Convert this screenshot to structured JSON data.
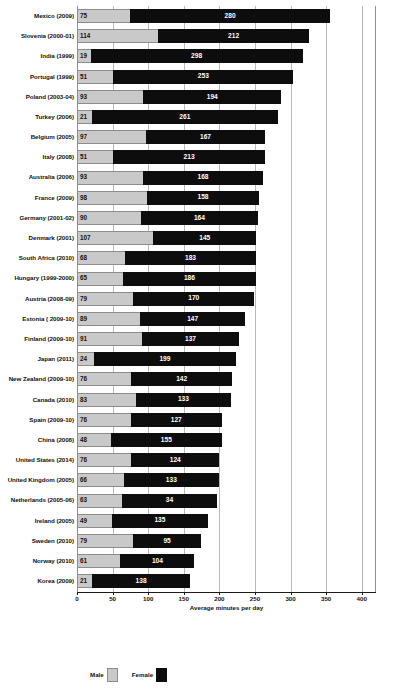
{
  "chart_data": {
    "type": "bar",
    "subtype": "stacked-horizontal",
    "title": "",
    "xlabel": "Average minutes per day",
    "ylabel": "",
    "xlim": [
      0,
      420
    ],
    "xticks": [
      0,
      50,
      100,
      150,
      200,
      250,
      300,
      350,
      400
    ],
    "grid": true,
    "legend_position": "bottom-left",
    "categories": [
      "Mexico (2009)",
      "Slovenia (2000-01)",
      "India (1999)",
      "Portugal (1999)",
      "Poland (2003-04)",
      "Turkey (2006)",
      "Belgium (2005)",
      "Italy (2008)",
      "Australia (2006)",
      "France (2009)",
      "Germany (2001-02)",
      "Denmark (2001)",
      "South Africa (2010)",
      "Hungary (1999-2000)",
      "Austria (2008-09)",
      "Estonia ( 2009-10)",
      "Finland (2009-10)",
      "Japan (2011)",
      "New Zealand (2009-10)",
      "Canada (2010)",
      "Spain (2009-10)",
      "China (2008)",
      "United States (2014)",
      "United Kingdom (2005)",
      "Netherlands (2005-06)",
      "Ireland (2005)",
      "Sweden (2010)",
      "Norway (2010)",
      "Korea (2009)"
    ],
    "series": [
      {
        "name": "Male",
        "color": "#c9c9c9",
        "values": [
          75,
          114,
          19,
          51,
          93,
          21,
          97,
          51,
          93,
          98,
          90,
          107,
          68,
          65,
          79,
          89,
          91,
          24,
          76,
          83,
          76,
          48,
          76,
          66,
          63,
          49,
          79,
          61,
          21
        ]
      },
      {
        "name": "Female",
        "color": "#0d0d0d",
        "values": [
          280,
          212,
          298,
          253,
          194,
          261,
          167,
          213,
          168,
          158,
          164,
          145,
          183,
          186,
          170,
          147,
          137,
          199,
          142,
          133,
          127,
          155,
          124,
          133,
          134,
          135,
          95,
          104,
          138
        ],
        "labels": [
          "280",
          "212",
          "298",
          "253",
          "194",
          "261",
          "167",
          "213",
          "168",
          "158",
          "164",
          "145",
          "183",
          "186",
          "170",
          "147",
          "137",
          "199",
          "142",
          "133",
          "127",
          "155",
          "124",
          "133",
          "34",
          "135",
          "95",
          "104",
          "138"
        ]
      }
    ]
  },
  "legend": {
    "items": [
      {
        "label": "Male",
        "swatch": "male-swatch"
      },
      {
        "label": "Female",
        "swatch": "female-swatch"
      }
    ]
  }
}
